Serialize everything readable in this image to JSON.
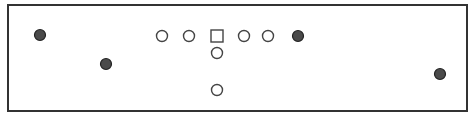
{
  "diagram": {
    "type": "formation",
    "colors": {
      "border": "#333333",
      "open_stroke": "#444444",
      "filled_fill": "#4a4a4a",
      "filled_stroke": "#222222",
      "background": "#ffffff"
    },
    "frame": {
      "x": 8,
      "y": 5,
      "width": 459,
      "height": 106
    },
    "offense": [
      {
        "id": "o1",
        "shape": "circle",
        "x": 162,
        "y": 36
      },
      {
        "id": "o2",
        "shape": "circle",
        "x": 189,
        "y": 36
      },
      {
        "id": "center",
        "shape": "square",
        "x": 217,
        "y": 36
      },
      {
        "id": "o4",
        "shape": "circle",
        "x": 244,
        "y": 36
      },
      {
        "id": "o5",
        "shape": "circle",
        "x": 268,
        "y": 36
      },
      {
        "id": "o6",
        "shape": "circle",
        "x": 217,
        "y": 53
      },
      {
        "id": "o7",
        "shape": "circle",
        "x": 217,
        "y": 90
      }
    ],
    "players_filled": [
      {
        "id": "f1",
        "x": 40,
        "y": 35
      },
      {
        "id": "f2",
        "x": 106,
        "y": 64
      },
      {
        "id": "f3",
        "x": 298,
        "y": 36
      },
      {
        "id": "f4",
        "x": 440,
        "y": 74
      }
    ]
  }
}
